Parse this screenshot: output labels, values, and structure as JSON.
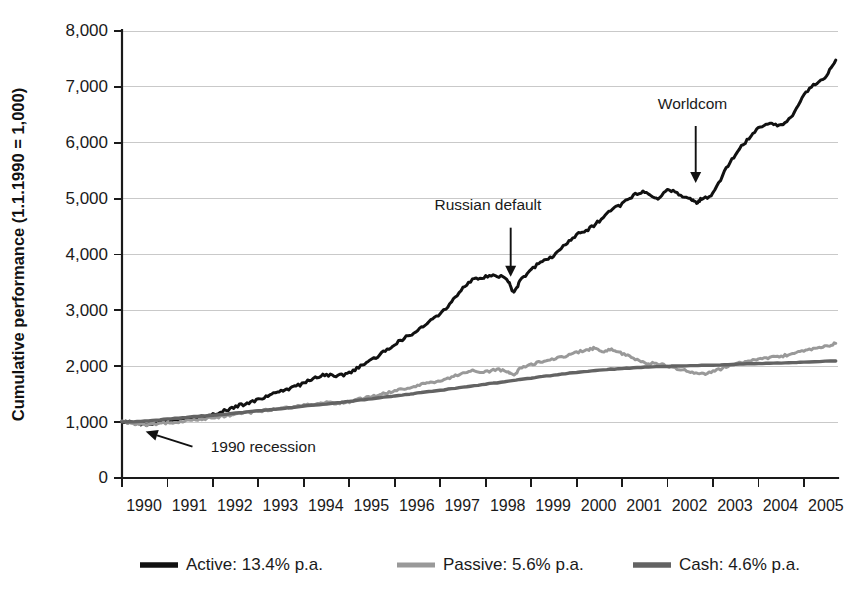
{
  "chart_data": {
    "type": "line",
    "title": "",
    "xlabel": "",
    "ylabel": "Cumulative performance (1.1.1990 = 1,000)",
    "xlim": [
      1990,
      2005.75
    ],
    "ylim": [
      0,
      8000
    ],
    "grid": true,
    "legend_position": "bottom",
    "y_ticks": [
      0,
      1000,
      2000,
      3000,
      4000,
      5000,
      6000,
      7000,
      8000
    ],
    "y_tick_labels": [
      "0",
      "1,000",
      "2,000",
      "3,000",
      "4,000",
      "5,000",
      "6,000",
      "7,000",
      "8,000"
    ],
    "x_ticks": [
      1990,
      1991,
      1992,
      1993,
      1994,
      1995,
      1996,
      1997,
      1998,
      1999,
      2000,
      2001,
      2002,
      2003,
      2004,
      2005
    ],
    "x_tick_labels": [
      "1990",
      "1991",
      "1992",
      "1993",
      "1994",
      "1995",
      "1996",
      "1997",
      "1998",
      "1999",
      "2000",
      "2001",
      "2002",
      "2003",
      "2004",
      "2005"
    ],
    "series": [
      {
        "name": "Active",
        "legend_label": "Active: 13.4% p.a.",
        "color": "#111111",
        "width": 3.0,
        "x": [
          1990.0,
          1990.25,
          1990.5,
          1990.75,
          1991.0,
          1991.25,
          1991.5,
          1991.75,
          1992.0,
          1992.25,
          1992.5,
          1992.75,
          1993.0,
          1993.25,
          1993.5,
          1993.75,
          1994.0,
          1994.25,
          1994.5,
          1994.75,
          1995.0,
          1995.25,
          1995.5,
          1995.75,
          1996.0,
          1996.25,
          1996.5,
          1996.75,
          1997.0,
          1997.25,
          1997.5,
          1997.75,
          1998.0,
          1998.25,
          1998.5,
          1998.62,
          1998.75,
          1999.0,
          1999.25,
          1999.5,
          1999.75,
          2000.0,
          2000.25,
          2000.5,
          2000.75,
          2001.0,
          2001.25,
          2001.5,
          2001.75,
          2002.0,
          2002.25,
          2002.5,
          2002.62,
          2002.75,
          2003.0,
          2003.25,
          2003.5,
          2003.75,
          2004.0,
          2004.25,
          2004.5,
          2004.75,
          2005.0,
          2005.25,
          2005.5,
          2005.7
        ],
        "y": [
          1000,
          990,
          960,
          985,
          1010,
          1040,
          1060,
          1090,
          1130,
          1200,
          1280,
          1330,
          1400,
          1480,
          1560,
          1620,
          1700,
          1800,
          1840,
          1830,
          1880,
          2000,
          2120,
          2250,
          2400,
          2520,
          2650,
          2800,
          2950,
          3150,
          3400,
          3560,
          3600,
          3620,
          3520,
          3330,
          3520,
          3720,
          3900,
          3980,
          4180,
          4350,
          4450,
          4600,
          4780,
          4900,
          5050,
          5120,
          5000,
          5150,
          5080,
          5000,
          4930,
          5000,
          5100,
          5480,
          5800,
          6050,
          6250,
          6350,
          6300,
          6500,
          6850,
          7050,
          7200,
          7480
        ]
      },
      {
        "name": "Passive",
        "legend_label": "Passive: 5.6% p.a.",
        "color": "#999999",
        "width": 3.0,
        "x": [
          1990.0,
          1990.25,
          1990.5,
          1990.75,
          1991.0,
          1991.25,
          1991.5,
          1991.75,
          1992.0,
          1992.25,
          1992.5,
          1992.75,
          1993.0,
          1993.25,
          1993.5,
          1993.75,
          1994.0,
          1994.25,
          1994.5,
          1994.75,
          1995.0,
          1995.25,
          1995.5,
          1995.75,
          1996.0,
          1996.25,
          1996.5,
          1996.75,
          1997.0,
          1997.25,
          1997.5,
          1997.75,
          1998.0,
          1998.25,
          1998.5,
          1998.62,
          1998.75,
          1999.0,
          1999.25,
          1999.5,
          1999.75,
          2000.0,
          2000.25,
          2000.4,
          2000.6,
          2000.8,
          2001.0,
          2001.25,
          2001.5,
          2001.75,
          2002.0,
          2002.25,
          2002.5,
          2002.75,
          2003.0,
          2003.25,
          2003.5,
          2003.75,
          2004.0,
          2004.25,
          2004.5,
          2004.75,
          2005.0,
          2005.25,
          2005.5,
          2005.7
        ],
        "y": [
          1000,
          975,
          950,
          965,
          990,
          1010,
          1030,
          1055,
          1080,
          1110,
          1140,
          1165,
          1190,
          1220,
          1250,
          1275,
          1300,
          1330,
          1345,
          1340,
          1370,
          1420,
          1460,
          1510,
          1560,
          1600,
          1650,
          1700,
          1740,
          1800,
          1880,
          1920,
          1900,
          1940,
          1900,
          1860,
          1950,
          2030,
          2080,
          2130,
          2180,
          2250,
          2290,
          2320,
          2270,
          2300,
          2230,
          2140,
          2060,
          2050,
          2010,
          1950,
          1900,
          1860,
          1900,
          1980,
          2040,
          2080,
          2120,
          2160,
          2180,
          2220,
          2270,
          2320,
          2360,
          2410
        ]
      },
      {
        "name": "Cash",
        "legend_label": "Cash: 4.6% p.a.",
        "color": "#636363",
        "width": 3.4,
        "x": [
          1990.0,
          1990.5,
          1991.0,
          1991.5,
          1992.0,
          1992.5,
          1993.0,
          1993.5,
          1994.0,
          1994.5,
          1995.0,
          1995.5,
          1996.0,
          1996.5,
          1997.0,
          1997.5,
          1998.0,
          1998.5,
          1999.0,
          1999.5,
          2000.0,
          2000.5,
          2001.0,
          2001.5,
          2002.0,
          2002.5,
          2003.0,
          2003.5,
          2004.0,
          2004.5,
          2005.0,
          2005.7
        ],
        "y": [
          1000,
          1020,
          1055,
          1090,
          1125,
          1160,
          1200,
          1240,
          1285,
          1325,
          1370,
          1420,
          1470,
          1520,
          1570,
          1625,
          1680,
          1730,
          1790,
          1840,
          1890,
          1930,
          1960,
          1985,
          2000,
          2010,
          2020,
          2035,
          2050,
          2060,
          2075,
          2095
        ]
      }
    ],
    "annotations": [
      {
        "text": "Russian default",
        "label_x": 1998.05,
        "label_y": 4800,
        "arrow_x": 1998.55,
        "arrow_top_y": 4480,
        "arrow_tip_y": 3600,
        "style": "vertical"
      },
      {
        "text": "Worldcom",
        "label_x": 2002.55,
        "label_y": 6600,
        "arrow_x": 2002.62,
        "arrow_top_y": 6300,
        "arrow_tip_y": 5280,
        "style": "vertical"
      },
      {
        "text": "1990 recession",
        "label_x": 1991.95,
        "label_y": 560,
        "arrow_from_x": 1991.55,
        "arrow_from_y": 560,
        "arrow_tip_x": 1990.52,
        "arrow_tip_y": 830,
        "style": "diagonal"
      }
    ]
  }
}
